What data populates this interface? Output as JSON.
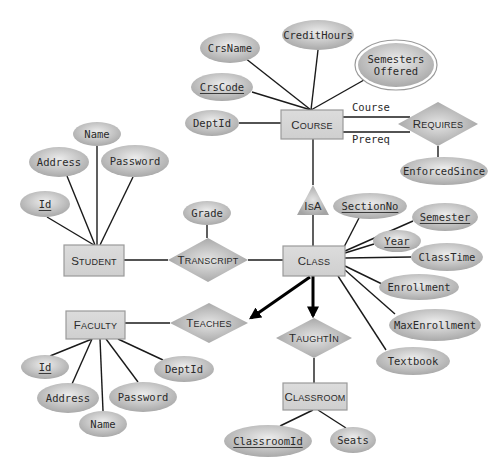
{
  "diagram": {
    "type": "er-diagram",
    "colors": {
      "oval_light": "#e8e8e8",
      "oval_dark": "#a9a9a9",
      "box_fill": "#d6d6d6",
      "box_border": "#9a9a9a",
      "diamond_light": "#e0e0e0",
      "diamond_dark": "#a4a4a4",
      "line": "#1a1a1a"
    },
    "entities": [
      {
        "id": "course",
        "label": "COURSE",
        "small_caps": [
          "C",
          "OURSE"
        ],
        "x": 281,
        "y": 110,
        "w": 62,
        "h": 29
      },
      {
        "id": "student",
        "label": "STUDENT",
        "small_caps": [
          "S",
          "TUDENT"
        ],
        "x": 64,
        "y": 245,
        "w": 60,
        "h": 31
      },
      {
        "id": "class",
        "label": "CLASS",
        "small_caps": [
          "C",
          "LASS"
        ],
        "x": 283,
        "y": 246,
        "w": 62,
        "h": 30
      },
      {
        "id": "faculty",
        "label": "FACULTY",
        "small_caps": [
          "F",
          "ACULTY"
        ],
        "x": 66,
        "y": 311,
        "w": 59,
        "h": 28
      },
      {
        "id": "classroom",
        "label": "CLASSROOM",
        "small_caps": [
          "C",
          "LASSROOM"
        ],
        "x": 283,
        "y": 383,
        "w": 64,
        "h": 27
      }
    ],
    "relationships": [
      {
        "id": "requires",
        "label": "REQUIRES",
        "small_caps": [
          "R",
          "EQUIRES"
        ],
        "cx": 438,
        "cy": 124,
        "hw": 40,
        "hh": 22
      },
      {
        "id": "transcript",
        "label": "TRANSCRIPT",
        "small_caps": [
          "T",
          "RANSCRIPT"
        ],
        "cx": 208,
        "cy": 260,
        "hw": 40,
        "hh": 22
      },
      {
        "id": "teaches",
        "label": "TEACHES",
        "small_caps": [
          "T",
          "EACHES"
        ],
        "cx": 209,
        "cy": 323,
        "hw": 39,
        "hh": 20
      },
      {
        "id": "taughtin",
        "label": "TAUGHTIN",
        "small_caps": [
          "T",
          "AUGHT",
          "I",
          "N"
        ],
        "cx": 314,
        "cy": 338,
        "hw": 38,
        "hh": 20
      }
    ],
    "isa": {
      "label": "ISA",
      "small_caps": [
        "I",
        "S",
        "A"
      ],
      "apex_x": 313,
      "apex_y": 185,
      "base_y": 215,
      "half_w": 16
    },
    "attributes": [
      {
        "id": "crsname",
        "label": "CrsName",
        "key": false,
        "multivalued": false,
        "cx": 230,
        "cy": 48,
        "rx": 30,
        "ry": 15,
        "owner": "course"
      },
      {
        "id": "credithours",
        "label": "CreditHours",
        "key": false,
        "multivalued": false,
        "cx": 318,
        "cy": 35,
        "rx": 36,
        "ry": 15,
        "owner": "course"
      },
      {
        "id": "semestersoffered",
        "label": "Semesters Offered",
        "lines": [
          "Semesters",
          "Offered"
        ],
        "key": false,
        "multivalued": true,
        "cx": 396,
        "cy": 65,
        "rx": 38,
        "ry": 22,
        "owner": "course"
      },
      {
        "id": "crscode",
        "label": "CrsCode",
        "key": true,
        "multivalued": false,
        "cx": 222,
        "cy": 87,
        "rx": 31,
        "ry": 14,
        "owner": "course"
      },
      {
        "id": "course-deptid",
        "label": "DeptId",
        "key": false,
        "multivalued": false,
        "cx": 212,
        "cy": 123,
        "rx": 27,
        "ry": 13,
        "owner": "course"
      },
      {
        "id": "enforcedsince",
        "label": "EnforcedSince",
        "key": false,
        "multivalued": false,
        "cx": 444,
        "cy": 171,
        "rx": 44,
        "ry": 14,
        "owner": "requires"
      },
      {
        "id": "student-name",
        "label": "Name",
        "key": false,
        "multivalued": false,
        "cx": 97,
        "cy": 134,
        "rx": 24,
        "ry": 12,
        "owner": "student"
      },
      {
        "id": "student-address",
        "label": "Address",
        "key": false,
        "multivalued": false,
        "cx": 59,
        "cy": 162,
        "rx": 30,
        "ry": 15,
        "owner": "student"
      },
      {
        "id": "student-password",
        "label": "Password",
        "key": false,
        "multivalued": false,
        "cx": 135,
        "cy": 161,
        "rx": 34,
        "ry": 16,
        "owner": "student"
      },
      {
        "id": "student-id",
        "label": "Id",
        "key": true,
        "multivalued": false,
        "cx": 45,
        "cy": 204,
        "rx": 25,
        "ry": 13,
        "owner": "student"
      },
      {
        "id": "grade",
        "label": "Grade",
        "key": false,
        "multivalued": false,
        "cx": 207,
        "cy": 213,
        "rx": 24,
        "ry": 12,
        "owner": "transcript"
      },
      {
        "id": "sectionno",
        "label": "SectionNo",
        "key": true,
        "multivalued": false,
        "cx": 370,
        "cy": 206,
        "rx": 37,
        "ry": 13,
        "owner": "class"
      },
      {
        "id": "semester",
        "label": "Semester",
        "key": true,
        "multivalued": false,
        "cx": 445,
        "cy": 217,
        "rx": 33,
        "ry": 14,
        "owner": "class"
      },
      {
        "id": "year",
        "label": "Year",
        "key": true,
        "multivalued": false,
        "cx": 397,
        "cy": 241,
        "rx": 24,
        "ry": 11,
        "owner": "class"
      },
      {
        "id": "classtime",
        "label": "ClassTime",
        "key": false,
        "multivalued": false,
        "cx": 447,
        "cy": 257,
        "rx": 36,
        "ry": 14,
        "owner": "class"
      },
      {
        "id": "enrollment",
        "label": "Enrollment",
        "key": false,
        "multivalued": false,
        "cx": 419,
        "cy": 287,
        "rx": 40,
        "ry": 13,
        "owner": "class"
      },
      {
        "id": "maxenrollment",
        "label": "MaxEnrollment",
        "key": false,
        "multivalued": false,
        "cx": 435,
        "cy": 325,
        "rx": 46,
        "ry": 16,
        "owner": "class"
      },
      {
        "id": "textbook",
        "label": "Textbook",
        "key": false,
        "multivalued": false,
        "cx": 413,
        "cy": 361,
        "rx": 37,
        "ry": 14,
        "owner": "class"
      },
      {
        "id": "faculty-id",
        "label": "Id",
        "key": true,
        "multivalued": false,
        "cx": 45,
        "cy": 367,
        "rx": 24,
        "ry": 12,
        "owner": "faculty"
      },
      {
        "id": "faculty-address",
        "label": "Address",
        "key": false,
        "multivalued": false,
        "cx": 68,
        "cy": 398,
        "rx": 31,
        "ry": 15,
        "owner": "faculty"
      },
      {
        "id": "faculty-name",
        "label": "Name",
        "key": false,
        "multivalued": false,
        "cx": 103,
        "cy": 424,
        "rx": 24,
        "ry": 13,
        "owner": "faculty"
      },
      {
        "id": "faculty-password",
        "label": "Password",
        "key": false,
        "multivalued": false,
        "cx": 143,
        "cy": 397,
        "rx": 34,
        "ry": 15,
        "owner": "faculty"
      },
      {
        "id": "faculty-deptid",
        "label": "DeptId",
        "key": false,
        "multivalued": false,
        "cx": 184,
        "cy": 369,
        "rx": 30,
        "ry": 13,
        "owner": "faculty"
      },
      {
        "id": "classroomid",
        "label": "ClassroomId",
        "key": true,
        "multivalued": false,
        "cx": 268,
        "cy": 441,
        "rx": 44,
        "ry": 16,
        "owner": "classroom"
      },
      {
        "id": "seats",
        "label": "Seats",
        "key": false,
        "multivalued": false,
        "cx": 353,
        "cy": 440,
        "rx": 23,
        "ry": 13,
        "owner": "classroom"
      }
    ],
    "role_labels": [
      {
        "id": "role-course",
        "label": "Course",
        "x": 352,
        "y": 111
      },
      {
        "id": "role-prereq",
        "label": "Prereq",
        "x": 352,
        "y": 143
      }
    ],
    "edges": [
      {
        "from": [
          311,
          110
        ],
        "to": [
          245,
          58
        ],
        "bold": false,
        "arrow": false
      },
      {
        "from": [
          311,
          110
        ],
        "to": [
          318,
          50
        ],
        "bold": false,
        "arrow": false
      },
      {
        "from": [
          311,
          110
        ],
        "to": [
          364,
          80
        ],
        "bold": false,
        "arrow": false
      },
      {
        "from": [
          311,
          110
        ],
        "to": [
          252,
          92
        ],
        "bold": false,
        "arrow": false
      },
      {
        "from": [
          239,
          123
        ],
        "to": [
          281,
          123
        ],
        "bold": false,
        "arrow": false
      },
      {
        "from": [
          343,
          117
        ],
        "to": [
          410,
          117
        ],
        "bold": false,
        "arrow": false
      },
      {
        "from": [
          343,
          132
        ],
        "to": [
          410,
          132
        ],
        "bold": false,
        "arrow": false
      },
      {
        "from": [
          438,
          146
        ],
        "to": [
          438,
          157
        ],
        "bold": false,
        "arrow": false
      },
      {
        "from": [
          313,
          139
        ],
        "to": [
          313,
          185
        ],
        "bold": false,
        "arrow": false
      },
      {
        "from": [
          313,
          215
        ],
        "to": [
          313,
          246
        ],
        "bold": false,
        "arrow": false
      },
      {
        "from": [
          97,
          146
        ],
        "to": [
          97,
          245
        ],
        "bold": false,
        "arrow": false
      },
      {
        "from": [
          67,
          176
        ],
        "to": [
          95,
          245
        ],
        "bold": false,
        "arrow": false
      },
      {
        "from": [
          133,
          177
        ],
        "to": [
          100,
          245
        ],
        "bold": false,
        "arrow": false
      },
      {
        "from": [
          47,
          217
        ],
        "to": [
          94,
          245
        ],
        "bold": false,
        "arrow": false
      },
      {
        "from": [
          124,
          260
        ],
        "to": [
          168,
          260
        ],
        "bold": false,
        "arrow": false
      },
      {
        "from": [
          248,
          260
        ],
        "to": [
          283,
          260
        ],
        "bold": false,
        "arrow": false
      },
      {
        "from": [
          207,
          225
        ],
        "to": [
          207,
          238
        ],
        "bold": false,
        "arrow": false
      },
      {
        "from": [
          343,
          249
        ],
        "to": [
          359,
          218
        ],
        "bold": false,
        "arrow": false
      },
      {
        "from": [
          345,
          251
        ],
        "to": [
          413,
          221
        ],
        "bold": false,
        "arrow": false
      },
      {
        "from": [
          345,
          253
        ],
        "to": [
          374,
          244
        ],
        "bold": false,
        "arrow": false
      },
      {
        "from": [
          345,
          258
        ],
        "to": [
          411,
          257
        ],
        "bold": false,
        "arrow": false
      },
      {
        "from": [
          345,
          266
        ],
        "to": [
          384,
          285
        ],
        "bold": false,
        "arrow": false
      },
      {
        "from": [
          345,
          270
        ],
        "to": [
          395,
          314
        ],
        "bold": false,
        "arrow": false
      },
      {
        "from": [
          338,
          276
        ],
        "to": [
          386,
          350
        ],
        "bold": false,
        "arrow": false
      },
      {
        "from": [
          313,
          276
        ],
        "to": [
          313,
          316
        ],
        "bold": true,
        "arrow": true
      },
      {
        "from": [
          310,
          277
        ],
        "to": [
          251,
          318
        ],
        "bold": true,
        "arrow": true
      },
      {
        "from": [
          125,
          323
        ],
        "to": [
          170,
          323
        ],
        "bold": false,
        "arrow": false
      },
      {
        "from": [
          92,
          339
        ],
        "to": [
          50,
          356
        ],
        "bold": false,
        "arrow": false
      },
      {
        "from": [
          92,
          339
        ],
        "to": [
          72,
          384
        ],
        "bold": false,
        "arrow": false
      },
      {
        "from": [
          100,
          339
        ],
        "to": [
          103,
          411
        ],
        "bold": false,
        "arrow": false
      },
      {
        "from": [
          106,
          339
        ],
        "to": [
          138,
          382
        ],
        "bold": false,
        "arrow": false
      },
      {
        "from": [
          118,
          339
        ],
        "to": [
          163,
          360
        ],
        "bold": false,
        "arrow": false
      },
      {
        "from": [
          314,
          358
        ],
        "to": [
          314,
          383
        ],
        "bold": false,
        "arrow": false
      },
      {
        "from": [
          313,
          410
        ],
        "to": [
          280,
          426
        ],
        "bold": false,
        "arrow": false
      },
      {
        "from": [
          318,
          410
        ],
        "to": [
          346,
          428
        ],
        "bold": false,
        "arrow": false
      }
    ]
  }
}
